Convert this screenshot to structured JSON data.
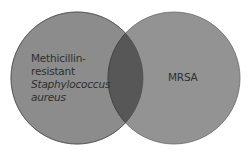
{
  "diagram": {
    "type": "venn",
    "colors": {
      "background": "#ffffff",
      "left_circle_fill": "#8c8c8c",
      "right_circle_fill": "#939393",
      "intersection_fill": "#575757",
      "outline": "#6a6a6a",
      "text": "#2f2f2f"
    },
    "sets": [
      {
        "id": "left",
        "label_lines": [
          {
            "text": "Methicillin-",
            "italic": false
          },
          {
            "text": "resistant",
            "italic": false
          },
          {
            "text": "Staphylococcus",
            "italic": true
          },
          {
            "text": "aureus",
            "italic": true
          }
        ]
      },
      {
        "id": "right",
        "label_lines": [
          {
            "text": "MRSA",
            "italic": false
          }
        ]
      }
    ],
    "intersection": {
      "label": ""
    }
  }
}
